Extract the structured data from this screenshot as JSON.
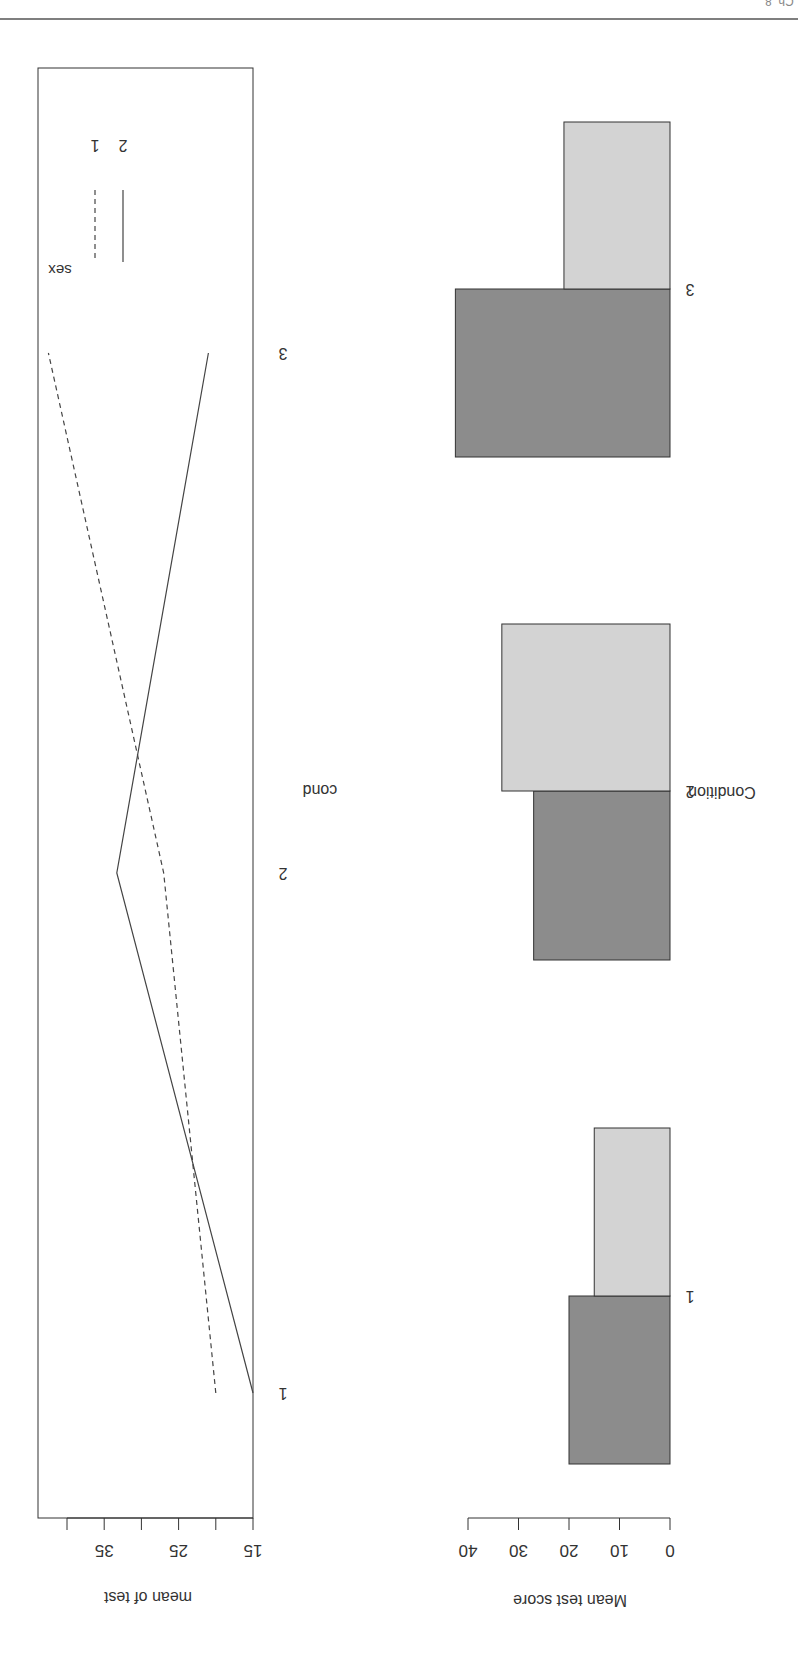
{
  "header": {
    "running_text": "Ch. 8"
  },
  "chart_data": [
    {
      "type": "line",
      "title": "",
      "xlabel": "cond",
      "ylabel": "mean of test",
      "categories": [
        "1",
        "2",
        "3"
      ],
      "yticks": [
        15,
        20,
        25,
        30,
        35,
        40
      ],
      "ytick_labels": [
        "15",
        "25",
        "35"
      ],
      "ylim": [
        15,
        42.5
      ],
      "legend": {
        "title": "sex",
        "position": "top-right",
        "entries": [
          "1",
          "2"
        ]
      },
      "series": [
        {
          "name": "1",
          "linestyle": "dashed",
          "values": [
            20,
            27,
            42.5
          ]
        },
        {
          "name": "2",
          "linestyle": "solid",
          "values": [
            15,
            33.3,
            21
          ]
        }
      ],
      "grid": false
    },
    {
      "type": "bar",
      "title": "",
      "xlabel": "Condition",
      "ylabel": "Mean test score",
      "categories": [
        "1",
        "2",
        "3"
      ],
      "yticks": [
        0,
        10,
        20,
        30,
        40
      ],
      "ylim": [
        0,
        40
      ],
      "series": [
        {
          "name": "sex 1",
          "color": "#8c8c8c",
          "values": [
            20,
            27,
            42.5
          ]
        },
        {
          "name": "sex 2",
          "color": "#d3d3d3",
          "values": [
            15,
            33.3,
            21
          ]
        }
      ],
      "grid": false
    }
  ],
  "colors": {
    "axis": "#333333",
    "bar_dark": "#8c8c8c",
    "bar_light": "#d3d3d3"
  }
}
